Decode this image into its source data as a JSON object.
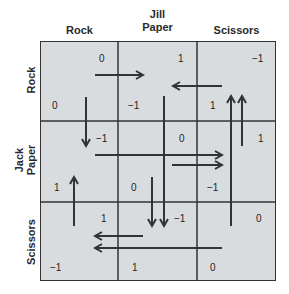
{
  "players": {
    "column_player": "Jill",
    "row_player": "Jack"
  },
  "strategies": [
    "Rock",
    "Paper",
    "Scissors"
  ],
  "column_labels": [
    "Rock",
    "Paper",
    "Scissors"
  ],
  "row_labels": [
    "Rock",
    "Paper",
    "Scissors"
  ],
  "cells": [
    [
      {
        "jill": "0",
        "jack": "0"
      },
      {
        "jill": "1",
        "jack": "−1"
      },
      {
        "jill": "−1",
        "jack": "1"
      }
    ],
    [
      {
        "jill": "−1",
        "jack": "1"
      },
      {
        "jill": "0",
        "jack": "0"
      },
      {
        "jill": "1",
        "jack": "−1"
      }
    ],
    [
      {
        "jill": "1",
        "jack": "−1"
      },
      {
        "jill": "−1",
        "jack": "1"
      },
      {
        "jill": "0",
        "jack": "0"
      }
    ]
  ],
  "colors": {
    "cell_fill": "#d9dcdf",
    "lines": "#333333"
  }
}
